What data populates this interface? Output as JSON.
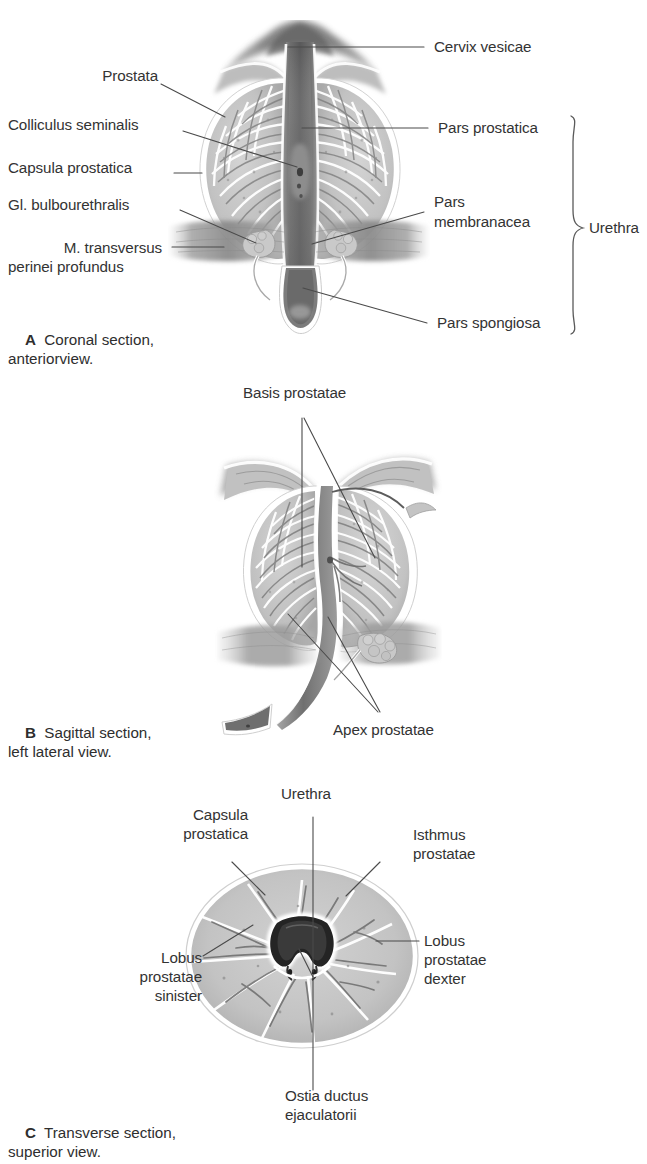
{
  "figure": {
    "panels": [
      {
        "id": "A",
        "letter": "A",
        "caption_line1": "Coronal section,",
        "caption_line2": "anteriorview.",
        "labels_left": [
          {
            "name": "prostata",
            "text": "Prostata"
          },
          {
            "name": "colliculus-seminalis",
            "text": "Colliculus seminalis"
          },
          {
            "name": "capsula-prostatica",
            "text": "Capsula prostatica"
          },
          {
            "name": "gl-bulbourethralis",
            "text": "Gl. bulbourethralis"
          },
          {
            "name": "m-transversus-perinei-profundus-l1",
            "text": "M. transversus"
          },
          {
            "name": "m-transversus-perinei-profundus-l2",
            "text": "perinei profundus"
          }
        ],
        "labels_right": [
          {
            "name": "cervix-vesicae",
            "text": "Cervix vesicae"
          },
          {
            "name": "pars-prostatica",
            "text": "Pars prostatica"
          },
          {
            "name": "pars-membranacea-l1",
            "text": "Pars"
          },
          {
            "name": "pars-membranacea-l2",
            "text": "membranacea"
          },
          {
            "name": "pars-spongiosa",
            "text": "Pars spongiosa"
          }
        ],
        "brace_label": "Urethra"
      },
      {
        "id": "B",
        "letter": "B",
        "caption_line1": "Sagittal section,",
        "caption_line2": "left lateral view.",
        "labels": [
          {
            "name": "basis-prostatae",
            "text": "Basis prostatae"
          },
          {
            "name": "apex-prostatae",
            "text": "Apex prostatae"
          }
        ]
      },
      {
        "id": "C",
        "letter": "C",
        "caption_line1": "Transverse section,",
        "caption_line2": "superior view.",
        "labels": [
          {
            "name": "urethra",
            "text": "Urethra"
          },
          {
            "name": "capsula-prostatica-l1",
            "text": "Capsula"
          },
          {
            "name": "capsula-prostatica-l2",
            "text": "prostatica"
          },
          {
            "name": "isthmus-prostatae-l1",
            "text": "Isthmus"
          },
          {
            "name": "isthmus-prostatae-l2",
            "text": "prostatae"
          },
          {
            "name": "lobus-prostatae-sinister-l1",
            "text": "Lobus"
          },
          {
            "name": "lobus-prostatae-sinister-l2",
            "text": "prostatae"
          },
          {
            "name": "lobus-prostatae-sinister-l3",
            "text": "sinister"
          },
          {
            "name": "lobus-prostatae-dexter-l1",
            "text": "Lobus"
          },
          {
            "name": "lobus-prostatae-dexter-l2",
            "text": "prostatae"
          },
          {
            "name": "lobus-prostatae-dexter-l3",
            "text": "dexter"
          },
          {
            "name": "ostia-ductus-ejaculatorii-l1",
            "text": "Ostia ductus"
          },
          {
            "name": "ostia-ductus-ejaculatorii-l2",
            "text": "ejaculatorii"
          }
        ]
      }
    ],
    "colors": {
      "text": "#333333",
      "leader_line": "#4a4a4a",
      "tissue": "#c3c3c3",
      "tissue_dark": "#8f8f8f",
      "capsule": "#ffffff",
      "lumen_dark": "#5b5b5b",
      "background": "#ffffff"
    }
  }
}
